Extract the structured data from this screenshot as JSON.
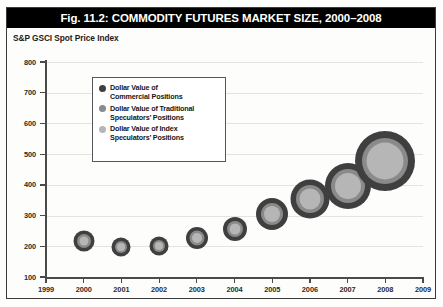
{
  "figure": {
    "title": "Fig. 11.2: COMMODITY FUTURES MARKET SIZE, 2000–2008",
    "subtitle": "S&P GSCI Spot Price Index"
  },
  "colors": {
    "title_bar_bg": "#000000",
    "title_text": "#ffffff",
    "commercial": "#3f3f3f",
    "traditional_speculators": "#8a8a8a",
    "index_speculators": "#b6b6b6",
    "gridline": "#e3e3e0",
    "axis": "#4a4a48",
    "frame": "#3a3a38",
    "background": "#fdfdfb"
  },
  "legend": {
    "position": "inside-top-left",
    "items": [
      {
        "label": "Dollar Value of\nCommercial Positions",
        "color": "#3f3f3f",
        "swatch": "circle-marker-icon"
      },
      {
        "label": "Dollar Value of Traditional\nSpeculators’ Positions",
        "color": "#8a8a8a",
        "swatch": "circle-marker-icon"
      },
      {
        "label": "Dollar Value of Index\nSpeculators’ Positions",
        "color": "#b6b6b6",
        "swatch": "circle-marker-icon"
      }
    ]
  },
  "chart_data": {
    "type": "scatter",
    "subtype": "bubble",
    "title": "Fig. 11.2: COMMODITY FUTURES MARKET SIZE, 2000–2008",
    "subtitle": "S&P GSCI Spot Price Index",
    "xlabel": "",
    "ylabel": "S&P GSCI Spot Price Index",
    "xlim": [
      1999,
      2009
    ],
    "ylim": [
      100,
      800
    ],
    "xticks": [
      1999,
      2000,
      2001,
      2002,
      2003,
      2004,
      2005,
      2006,
      2007,
      2008,
      2009
    ],
    "yticks": [
      100,
      200,
      300,
      400,
      500,
      600,
      700,
      800
    ],
    "grid": true,
    "grid_axis": "y",
    "legend_position": "upper left inside plot",
    "x": [
      2000,
      2001,
      2002,
      2003,
      2004,
      2005,
      2006,
      2007,
      2008
    ],
    "y": [
      218,
      198,
      200,
      228,
      255,
      305,
      355,
      398,
      478
    ],
    "note": "Each marker is a set of three concentric circles; outer ring = Commercial Positions, middle ring = Traditional Speculators' Positions, inner disc = Index Speculators' Positions. Bubble area grows each year, indicating total market size growth.",
    "series": [
      {
        "name": "Dollar Value of Commercial Positions",
        "color": "#3f3f3f",
        "ring": "outer",
        "bubble_diameter_px": [
          21,
          19,
          19,
          22,
          24,
          32,
          39,
          46,
          60
        ]
      },
      {
        "name": "Dollar Value of Traditional Speculators’ Positions",
        "color": "#8a8a8a",
        "ring": "middle",
        "bubble_diameter_px": [
          14,
          12,
          12,
          15,
          16,
          22,
          28,
          34,
          46
        ]
      },
      {
        "name": "Dollar Value of Index Speculators’ Positions",
        "color": "#b6b6b6",
        "ring": "inner",
        "bubble_diameter_px": [
          9,
          8,
          8,
          10,
          11,
          16,
          21,
          26,
          37
        ]
      }
    ],
    "points": [
      {
        "year": "2000",
        "value": 218,
        "outer_px": 21,
        "mid_px": 14,
        "inner_px": 9
      },
      {
        "year": "2001",
        "value": 198,
        "outer_px": 19,
        "mid_px": 12,
        "inner_px": 8
      },
      {
        "year": "2002",
        "value": 200,
        "outer_px": 19,
        "mid_px": 12,
        "inner_px": 8
      },
      {
        "year": "2003",
        "value": 228,
        "outer_px": 22,
        "mid_px": 15,
        "inner_px": 10
      },
      {
        "year": "2004",
        "value": 255,
        "outer_px": 24,
        "mid_px": 16,
        "inner_px": 11
      },
      {
        "year": "2005",
        "value": 305,
        "outer_px": 32,
        "mid_px": 22,
        "inner_px": 16
      },
      {
        "year": "2006",
        "value": 355,
        "outer_px": 39,
        "mid_px": 28,
        "inner_px": 21
      },
      {
        "year": "2007",
        "value": 398,
        "outer_px": 46,
        "mid_px": 34,
        "inner_px": 26
      },
      {
        "year": "2008",
        "value": 478,
        "outer_px": 60,
        "mid_px": 46,
        "inner_px": 37
      }
    ]
  }
}
